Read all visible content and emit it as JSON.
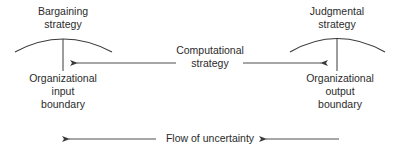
{
  "diagram": {
    "left_node": {
      "strategy_label": "Bargaining\nstrategy",
      "boundary_label": "Organizational\ninput\nboundary"
    },
    "right_node": {
      "strategy_label": "Judgmental\nstrategy",
      "boundary_label": "Organizational\noutput\nboundary"
    },
    "center_label": "Computational\nstrategy",
    "flow_label": "Flow of uncertainty",
    "colors": {
      "line": "#3a3a3a",
      "text": "#2b2b2b",
      "background": "#ffffff"
    }
  }
}
